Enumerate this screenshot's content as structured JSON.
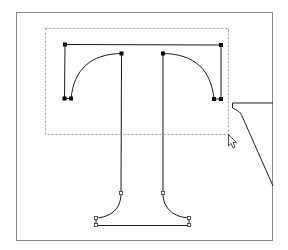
{
  "app": {
    "view": "glyph-outline-editor",
    "glyph": "T"
  },
  "selection": {
    "mode": "marquee",
    "selected_node_count": 8,
    "unselected_node_count": 8
  },
  "colors": {
    "frame": "#8a8a8a",
    "outline": "#1a1a1a",
    "selected_node": "#000000",
    "unselected_node": "#ffffff",
    "marquee": "#9a9a9a",
    "background": "#ffffff"
  },
  "icons": {
    "cursor": "arrow-pointer-icon"
  }
}
